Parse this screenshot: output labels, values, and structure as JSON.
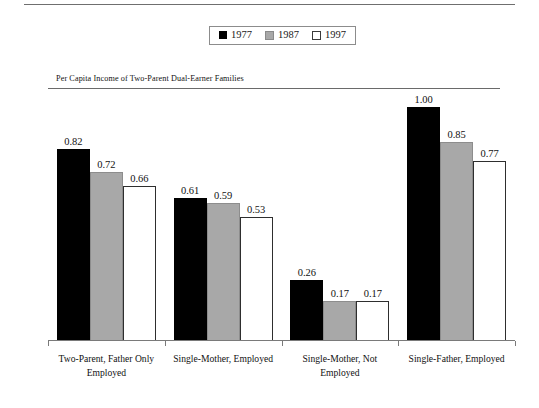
{
  "chart_data": {
    "type": "bar",
    "title": "",
    "subtitle": "",
    "xlabel": "",
    "ylabel": "",
    "ylim": [
      0,
      1.08
    ],
    "grid": false,
    "legend_position": "top-center",
    "categories": [
      "Two-Parent, Father Only Employed",
      "Single-Mother, Employed",
      "Single-Mother, Not Employed",
      "Single-Father, Employed"
    ],
    "category_lines": [
      [
        "Two-Parent, Father Only",
        "Employed"
      ],
      [
        "Single-Mother, Employed"
      ],
      [
        "Single-Mother, Not",
        "Employed"
      ],
      [
        "Single-Father, Employed"
      ]
    ],
    "series": [
      {
        "name": "1977",
        "color": "#000000",
        "values": [
          0.82,
          0.61,
          0.26,
          1.0
        ],
        "labels": [
          "0.82",
          "0.61",
          "0.26",
          "1.00"
        ]
      },
      {
        "name": "1987",
        "color": "#a8a8a8",
        "values": [
          0.72,
          0.59,
          0.17,
          0.85
        ],
        "labels": [
          "0.72",
          "0.59",
          "0.17",
          "0.85"
        ]
      },
      {
        "name": "1997",
        "color": "#ffffff",
        "values": [
          0.66,
          0.53,
          0.17,
          0.77
        ],
        "labels": [
          "0.66",
          "0.53",
          "0.17",
          "0.77"
        ]
      }
    ],
    "reference_line": {
      "value": 1.0,
      "label": "Per Capita Income of Two-Parent Dual-Earner Families"
    }
  },
  "legend": {
    "items": [
      {
        "label": "1977",
        "swatch": "filled-black-square-icon"
      },
      {
        "label": "1987",
        "swatch": "filled-gray-square-icon"
      },
      {
        "label": "1997",
        "swatch": "outlined-white-square-icon"
      }
    ]
  }
}
